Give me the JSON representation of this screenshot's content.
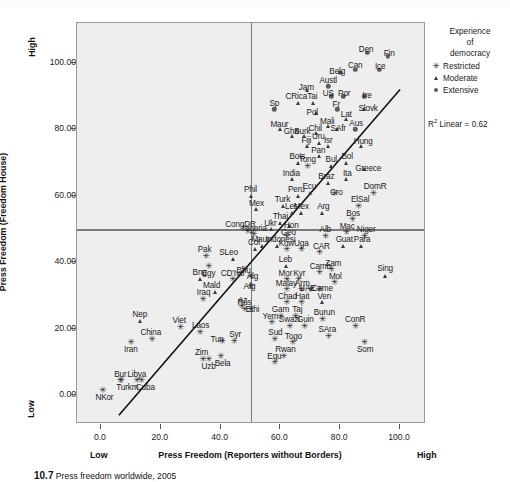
{
  "figure": {
    "caption_number": "10.7",
    "caption_text": "Press freedom worldwide, 2005"
  },
  "legend": {
    "title_line1": "Experience",
    "title_line2": "of",
    "title_line3": "democracy",
    "items": [
      {
        "label": "Restricted",
        "icon": "star-marker-icon",
        "symbol": "✳"
      },
      {
        "label": "Moderate",
        "icon": "triangle-marker-icon",
        "symbol": "▲"
      },
      {
        "label": "Extensive",
        "icon": "circle-marker-icon",
        "symbol": "●"
      }
    ]
  },
  "annotation": {
    "r2_label": "R",
    "r2_sup": "2",
    "r2_value": " Linear = 0.62"
  },
  "chart_data": {
    "type": "scatter",
    "title": "",
    "xlabel": "Press Freedom (Reporters without Borders)",
    "ylabel": "Press Freedom (Freedom House)",
    "xlim": [
      -8,
      108
    ],
    "ylim": [
      -8,
      112
    ],
    "xticks": [
      "0.0",
      "20.0",
      "40.0",
      "60.0",
      "80.0",
      "100.0"
    ],
    "xtick_values": [
      0,
      20,
      40,
      60,
      80,
      100
    ],
    "yticks": [
      "0.00",
      "20.00",
      "40.00",
      "60.00",
      "80.00",
      "100.00"
    ],
    "ytick_values": [
      0,
      20,
      40,
      60,
      80,
      100
    ],
    "x_low_label": "Low",
    "x_high_label": "High",
    "y_low_label": "Low",
    "y_high_label": "High",
    "grid": false,
    "reference_lines": {
      "horizontal_y": 50,
      "vertical_x": 50
    },
    "fit_line": {
      "x0": 6,
      "y0": -6,
      "x1": 100,
      "y1": 92,
      "r_squared": 0.62
    },
    "legend_position": "right",
    "series": [
      {
        "name": "Restricted",
        "marker": "star"
      },
      {
        "name": "Moderate",
        "marker": "triangle"
      },
      {
        "name": "Extensive",
        "marker": "circle"
      }
    ],
    "points": [
      {
        "label": "NKor",
        "x": 0.5,
        "y": 1.5,
        "g": "Restricted",
        "lx": 2,
        "ly": -6.5
      },
      {
        "label": "Turkm",
        "x": 6.5,
        "y": 4.5,
        "g": "Restricted",
        "lx": 7,
        "ly": -6.5
      },
      {
        "label": "Bur",
        "x": 6.5,
        "y": 4.5,
        "g": "Restricted",
        "lx": 0,
        "ly": 6.5
      },
      {
        "label": "Libya",
        "x": 12,
        "y": 4.5,
        "g": "Restricted",
        "lx": 0,
        "ly": 6.5
      },
      {
        "label": "Cuba",
        "x": 13.5,
        "y": 4.5,
        "g": "Restricted",
        "lx": 4,
        "ly": -6.5
      },
      {
        "label": "Iran",
        "x": 10,
        "y": 16,
        "g": "Restricted",
        "lx": 0,
        "ly": -7
      },
      {
        "label": "China",
        "x": 17,
        "y": 17,
        "g": "Restricted",
        "lx": -1,
        "ly": 7
      },
      {
        "label": "Nep",
        "x": 13,
        "y": 22.5,
        "g": "Moderate",
        "lx": 0,
        "ly": 7
      },
      {
        "label": "Viet",
        "x": 26.5,
        "y": 20.5,
        "g": "Restricted",
        "lx": -1,
        "ly": 7
      },
      {
        "label": "Laos",
        "x": 33,
        "y": 19,
        "g": "Restricted",
        "lx": 1,
        "ly": 7
      },
      {
        "label": "Zim",
        "x": 34,
        "y": 11,
        "g": "Restricted",
        "lx": -1,
        "ly": 7
      },
      {
        "label": "Uzb",
        "x": 36,
        "y": 11,
        "g": "Restricted",
        "lx": 0,
        "ly": -7
      },
      {
        "label": "Bela",
        "x": 40,
        "y": 12,
        "g": "Restricted",
        "lx": 2,
        "ly": -7
      },
      {
        "label": "Tun",
        "x": 40.5,
        "y": 16.5,
        "g": "Restricted",
        "lx": -5,
        "ly": 2
      },
      {
        "label": "Syr",
        "x": 44.5,
        "y": 16.5,
        "g": "Restricted",
        "lx": 1,
        "ly": 7
      },
      {
        "label": "Iraq",
        "x": 34,
        "y": 29,
        "g": "Restricted",
        "lx": 1,
        "ly": 7
      },
      {
        "label": "Mald",
        "x": 38,
        "y": 31,
        "g": "Moderate",
        "lx": -3,
        "ly": 7
      },
      {
        "label": "Bng",
        "x": 33,
        "y": 35,
        "g": "Moderate",
        "lx": 0,
        "ly": 7
      },
      {
        "label": "Egy",
        "x": 36,
        "y": 39,
        "g": "Restricted",
        "lx": 0,
        "ly": -7
      },
      {
        "label": "CD'Ivo",
        "x": 44,
        "y": 35,
        "g": "Restricted",
        "lx": 0,
        "ly": 6.5
      },
      {
        "label": "Pak",
        "x": 35,
        "y": 42,
        "g": "Restricted",
        "lx": -1,
        "ly": 7
      },
      {
        "label": "SLeo",
        "x": 44,
        "y": 41,
        "g": "Moderate",
        "lx": -4,
        "ly": 7
      },
      {
        "label": "Az",
        "x": 47,
        "y": 27,
        "g": "Restricted",
        "lx": 1,
        "ly": 6
      },
      {
        "label": "Rus",
        "x": 48,
        "y": 26,
        "g": "Restricted",
        "lx": 0,
        "ly": 6.5
      },
      {
        "label": "Bhu",
        "x": 48,
        "y": 38,
        "g": "Restricted",
        "lx": -1,
        "ly": -1
      },
      {
        "label": "Alg",
        "x": 50,
        "y": 36,
        "g": "Restricted",
        "lx": 2,
        "ly": 0
      },
      {
        "label": "Afg",
        "x": 50,
        "y": 33,
        "g": "Restricted",
        "lx": -1,
        "ly": 0
      },
      {
        "label": "Ethi",
        "x": 50,
        "y": 26,
        "g": "Restricted",
        "lx": 2,
        "ly": 0
      },
      {
        "label": "Col",
        "x": 51.5,
        "y": 44,
        "g": "Moderate",
        "lx": -1,
        "ly": 7
      },
      {
        "label": "Nigeria",
        "x": 51,
        "y": 48.5,
        "g": "Restricted",
        "lx": 1,
        "ly": 6.5
      },
      {
        "label": "CongDR",
        "x": 49,
        "y": 49.5,
        "g": "Restricted",
        "lx": -7,
        "ly": 6.5
      },
      {
        "label": "Phil",
        "x": 50,
        "y": 60,
        "g": "Moderate",
        "lx": 0,
        "ly": 6.5
      },
      {
        "label": "Mex",
        "x": 52,
        "y": 56,
        "g": "Moderate",
        "lx": 0,
        "ly": 6.5
      },
      {
        "label": "Maur",
        "x": 54,
        "y": 45,
        "g": "Moderate",
        "lx": -2,
        "ly": 6.5
      },
      {
        "label": "Indonesi",
        "x": 59,
        "y": 45,
        "g": "Moderate",
        "lx": 3,
        "ly": 6.5
      },
      {
        "label": "Ukr",
        "x": 57,
        "y": 50,
        "g": "Moderate",
        "lx": -1,
        "ly": 6.5
      },
      {
        "label": "Thai",
        "x": 60,
        "y": 52,
        "g": "Moderate",
        "lx": 0,
        "ly": 6.5
      },
      {
        "label": "Geo",
        "x": 62,
        "y": 48,
        "g": "Restricted",
        "lx": 2,
        "ly": 4
      },
      {
        "label": "Turk",
        "x": 61,
        "y": 57,
        "g": "Moderate",
        "lx": -1,
        "ly": 6.5
      },
      {
        "label": "Les",
        "x": 64,
        "y": 55,
        "g": "Moderate",
        "lx": -1,
        "ly": 6.5
      },
      {
        "label": "Mex2",
        "x": 67,
        "y": 55,
        "g": "Moderate",
        "lx": 0,
        "ly": 6.5
      },
      {
        "label": "Hon",
        "x": 63,
        "y": 51,
        "g": "Moderate",
        "lx": 2,
        "ly": 1
      },
      {
        "label": "Kuw",
        "x": 62,
        "y": 44,
        "g": "Restricted",
        "lx": 0,
        "ly": 6.5
      },
      {
        "label": "Uga",
        "x": 67,
        "y": 44,
        "g": "Restricted",
        "lx": 0,
        "ly": 6.5
      },
      {
        "label": "Leb",
        "x": 62,
        "y": 39,
        "g": "Moderate",
        "lx": -1,
        "ly": 6.5
      },
      {
        "label": "Mor",
        "x": 62,
        "y": 35,
        "g": "Restricted",
        "lx": -1,
        "ly": 6.5
      },
      {
        "label": "Kyr",
        "x": 66,
        "y": 35,
        "g": "Restricted",
        "lx": 1,
        "ly": 6.5
      },
      {
        "label": "Malay",
        "x": 62,
        "y": 32,
        "g": "Restricted",
        "lx": 0,
        "ly": 6.5
      },
      {
        "label": "Arm",
        "x": 67,
        "y": 32,
        "g": "Restricted",
        "lx": 1,
        "ly": 6.5
      },
      {
        "label": "Chad",
        "x": 62,
        "y": 28,
        "g": "Restricted",
        "lx": 1,
        "ly": 6.5
      },
      {
        "label": "Hait",
        "x": 67,
        "y": 28,
        "g": "Restricted",
        "lx": 1,
        "ly": 6.5
      },
      {
        "label": "Gam",
        "x": 60,
        "y": 24,
        "g": "Restricted",
        "lx": 0,
        "ly": 6.5
      },
      {
        "label": "Taj",
        "x": 65,
        "y": 24,
        "g": "Restricted",
        "lx": 2,
        "ly": 6.5
      },
      {
        "label": "Yem",
        "x": 57,
        "y": 22,
        "g": "Restricted",
        "lx": -1,
        "ly": 6.5
      },
      {
        "label": "Swazi",
        "x": 63,
        "y": 21,
        "g": "Restricted",
        "lx": 0,
        "ly": 6.5
      },
      {
        "label": "Guin",
        "x": 68,
        "y": 21,
        "g": "Restricted",
        "lx": 1,
        "ly": 6.5
      },
      {
        "label": "Sud",
        "x": 58,
        "y": 17,
        "g": "Restricted",
        "lx": 1,
        "ly": 6.5
      },
      {
        "label": "Togo",
        "x": 64,
        "y": 16,
        "g": "Restricted",
        "lx": 1,
        "ly": 6.5
      },
      {
        "label": "Rwan",
        "x": 61,
        "y": 12,
        "g": "Restricted",
        "lx": 2,
        "ly": 6.5
      },
      {
        "label": "Equ",
        "x": 58,
        "y": 10,
        "g": "Restricted",
        "lx": 0,
        "ly": 6.5
      },
      {
        "label": "UAE",
        "x": 70,
        "y": 32,
        "g": "Restricted",
        "lx": -3,
        "ly": 1
      },
      {
        "label": "Came",
        "x": 73,
        "y": 32,
        "g": "Restricted",
        "lx": 3,
        "ly": 1
      },
      {
        "label": "Camb",
        "x": 73,
        "y": 37,
        "g": "Restricted",
        "lx": 1,
        "ly": 6.5
      },
      {
        "label": "CAR",
        "x": 73,
        "y": 43,
        "g": "Restricted",
        "lx": 2,
        "ly": 6.5
      },
      {
        "label": "Zam",
        "x": 77,
        "y": 38,
        "g": "Restricted",
        "lx": 2,
        "ly": 6.5
      },
      {
        "label": "Mol",
        "x": 78,
        "y": 34,
        "g": "Restricted",
        "lx": 1,
        "ly": 6.5
      },
      {
        "label": "Ven",
        "x": 74,
        "y": 28,
        "g": "Moderate",
        "lx": 2,
        "ly": 6.5
      },
      {
        "label": "Burun",
        "x": 74,
        "y": 23,
        "g": "Restricted",
        "lx": 2,
        "ly": 6.5
      },
      {
        "label": "SAra",
        "x": 76,
        "y": 18,
        "g": "Restricted",
        "lx": -1,
        "ly": 6.5
      },
      {
        "label": "ConR",
        "x": 85,
        "y": 21,
        "g": "Restricted",
        "lx": 0,
        "ly": 6.5
      },
      {
        "label": "Som",
        "x": 88,
        "y": 16,
        "g": "Restricted",
        "lx": 1,
        "ly": -7
      },
      {
        "label": "Guat",
        "x": 81,
        "y": 45,
        "g": "Moderate",
        "lx": 1,
        "ly": 6.5
      },
      {
        "label": "Para",
        "x": 87,
        "y": 45,
        "g": "Moderate",
        "lx": 1,
        "ly": 6.5
      },
      {
        "label": "Sing",
        "x": 95,
        "y": 36,
        "g": "Moderate",
        "lx": 0,
        "ly": 7.5
      },
      {
        "label": "Alb",
        "x": 75,
        "y": 48,
        "g": "Restricted",
        "lx": 0,
        "ly": 6.5
      },
      {
        "label": "Mac",
        "x": 82,
        "y": 49,
        "g": "Restricted",
        "lx": 1,
        "ly": 6.5
      },
      {
        "label": "Niger",
        "x": 88,
        "y": 48,
        "g": "Restricted",
        "lx": 2,
        "ly": 6.5
      },
      {
        "label": "Bos",
        "x": 84,
        "y": 53,
        "g": "Restricted",
        "lx": 1,
        "ly": 6.5
      },
      {
        "label": "ElSal",
        "x": 86,
        "y": 57,
        "g": "Restricted",
        "lx": 2,
        "ly": 6.5
      },
      {
        "label": "Arg",
        "x": 74,
        "y": 55,
        "g": "Moderate",
        "lx": 1,
        "ly": 6.5
      },
      {
        "label": "DomR",
        "x": 91,
        "y": 61,
        "g": "Restricted",
        "lx": 2,
        "ly": 6.5
      },
      {
        "label": "Cro",
        "x": 78,
        "y": 61,
        "g": "Restricted",
        "lx": 2,
        "ly": 1
      },
      {
        "label": "Ita",
        "x": 82,
        "y": 65,
        "g": "Moderate",
        "lx": 1,
        "ly": 6.5
      },
      {
        "label": "Greece",
        "x": 88,
        "y": 68,
        "g": "Moderate",
        "lx": 4,
        "ly": 1
      },
      {
        "label": "Bol",
        "x": 82,
        "y": 70,
        "g": "Moderate",
        "lx": 1,
        "ly": 6.5
      },
      {
        "label": "Bul",
        "x": 77,
        "y": 69,
        "g": "Moderate",
        "lx": 0,
        "ly": 6.5
      },
      {
        "label": "Pan",
        "x": 73,
        "y": 72,
        "g": "Moderate",
        "lx": -1,
        "ly": 6.5
      },
      {
        "label": "Braz",
        "x": 76,
        "y": 64,
        "g": "Moderate",
        "lx": -2,
        "ly": 6.5
      },
      {
        "label": "Tong",
        "x": 69,
        "y": 69,
        "g": "Restricted",
        "lx": 0,
        "ly": 6.5
      },
      {
        "label": "Bots",
        "x": 66,
        "y": 70,
        "g": "Moderate",
        "lx": -1,
        "ly": 6.5
      },
      {
        "label": "India",
        "x": 64,
        "y": 65,
        "g": "Moderate",
        "lx": -1,
        "ly": 6.5
      },
      {
        "label": "Peru",
        "x": 66,
        "y": 60,
        "g": "Moderate",
        "lx": -2,
        "ly": 6.5
      },
      {
        "label": "Ecu",
        "x": 70,
        "y": 61,
        "g": "Moderate",
        "lx": -1,
        "ly": 6.5
      },
      {
        "label": "Isr",
        "x": 76,
        "y": 75,
        "g": "Moderate",
        "lx": 0,
        "ly": 6.5
      },
      {
        "label": "Uru",
        "x": 73,
        "y": 76,
        "g": "Moderate",
        "lx": -1,
        "ly": 6.5
      },
      {
        "label": "Fiji",
        "x": 69,
        "y": 75,
        "g": "Moderate",
        "lx": -1,
        "ly": 6.5
      },
      {
        "label": "Hung",
        "x": 87,
        "y": 75,
        "g": "Moderate",
        "lx": 2,
        "ly": 5
      },
      {
        "label": "SAfr",
        "x": 79,
        "y": 80,
        "g": "Moderate",
        "lx": 1,
        "ly": 1
      },
      {
        "label": "Mali",
        "x": 76,
        "y": 81,
        "g": "Moderate",
        "lx": -1,
        "ly": 5
      },
      {
        "label": "Aus",
        "x": 85,
        "y": 80,
        "g": "Extensive",
        "lx": 1,
        "ly": 6.5
      },
      {
        "label": "Chil",
        "x": 72,
        "y": 79,
        "g": "Moderate",
        "lx": -1,
        "ly": 5
      },
      {
        "label": "Burk",
        "x": 68,
        "y": 78,
        "g": "Moderate",
        "lx": -2,
        "ly": 5
      },
      {
        "label": "Gha",
        "x": 64,
        "y": 78,
        "g": "Moderate",
        "lx": -1,
        "ly": 5
      },
      {
        "label": "Maur2",
        "x": 60,
        "y": 80,
        "g": "Moderate",
        "lx": -1,
        "ly": 5
      },
      {
        "label": "Lat",
        "x": 82,
        "y": 83,
        "g": "Moderate",
        "lx": 0,
        "ly": 5
      },
      {
        "label": "Pol",
        "x": 72,
        "y": 85,
        "g": "Moderate",
        "lx": -4,
        "ly": 1
      },
      {
        "label": "Fr",
        "x": 79,
        "y": 86,
        "g": "Extensive",
        "lx": -1,
        "ly": 5
      },
      {
        "label": "Sp",
        "x": 58,
        "y": 86,
        "g": "Extensive",
        "lx": 0,
        "ly": 6.5
      },
      {
        "label": "Tai",
        "x": 71,
        "y": 88,
        "g": "Moderate",
        "lx": -1,
        "ly": 6.5
      },
      {
        "label": "CRica",
        "x": 66,
        "y": 88,
        "g": "Moderate",
        "lx": -2,
        "ly": 6.5
      },
      {
        "label": "Slovk",
        "x": 88,
        "y": 86,
        "g": "Moderate",
        "lx": 4,
        "ly": 1
      },
      {
        "label": "US",
        "x": 77,
        "y": 90,
        "g": "Extensive",
        "lx": -3,
        "ly": 3
      },
      {
        "label": "Por",
        "x": 81,
        "y": 90,
        "g": "Extensive",
        "lx": 1,
        "ly": 3
      },
      {
        "label": "Jam",
        "x": 69,
        "y": 92,
        "g": "Moderate",
        "lx": -1,
        "ly": 3
      },
      {
        "label": "Austl",
        "x": 76,
        "y": 93,
        "g": "Extensive",
        "lx": 0,
        "ly": 6.5
      },
      {
        "label": "Ire",
        "x": 88,
        "y": 90,
        "g": "Extensive",
        "lx": 3,
        "ly": 1
      },
      {
        "label": "Belg",
        "x": 80,
        "y": 97,
        "g": "Extensive",
        "lx": -3,
        "ly": 2
      },
      {
        "label": "Can",
        "x": 85,
        "y": 98,
        "g": "Extensive",
        "lx": 0,
        "ly": 5
      },
      {
        "label": "Ice",
        "x": 93,
        "y": 98,
        "g": "Extensive",
        "lx": 1,
        "ly": 4
      },
      {
        "label": "Den",
        "x": 89,
        "y": 103,
        "g": "Extensive",
        "lx": -1,
        "ly": 4
      },
      {
        "label": "Fin",
        "x": 96,
        "y": 102,
        "g": "Extensive",
        "lx": 1,
        "ly": 3
      }
    ]
  }
}
